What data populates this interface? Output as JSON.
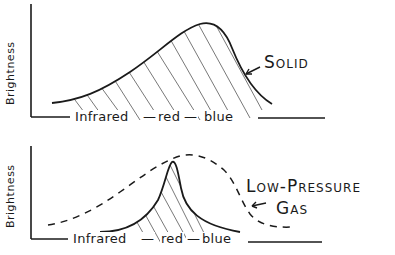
{
  "diagram": {
    "panels": [
      {
        "id": "solid",
        "y_axis_label": "Brightness",
        "x_axis": {
          "labels": [
            "Infrared",
            "red",
            "blue"
          ],
          "sep": "—"
        },
        "curve_label": "Solid",
        "curve_style": "solid, broad continuous hump, hatched underneath"
      },
      {
        "id": "gas",
        "y_axis_label": "Brightness",
        "x_axis": {
          "labels": [
            "Infrared",
            "red",
            "blue"
          ],
          "sep": "—"
        },
        "curve_label_line1": "Low-Pressure",
        "curve_label_line2": "Gas",
        "curve_style": "narrow hatched emission peak with dashed broad hump overlay"
      }
    ],
    "stroke_color": "#1a1a1a",
    "hatch_color": "#555555"
  }
}
